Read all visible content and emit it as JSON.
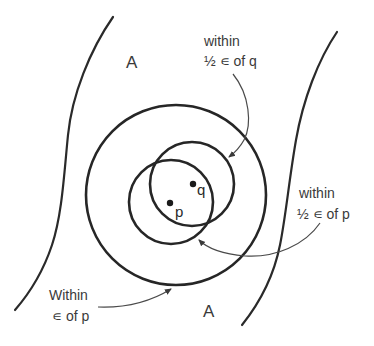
{
  "diagram": {
    "regions": [
      {
        "id": "region-a-top",
        "label": "A"
      },
      {
        "id": "region-a-bottom",
        "label": "A"
      }
    ],
    "points": [
      {
        "id": "p",
        "label": "p"
      },
      {
        "id": "q",
        "label": "q"
      }
    ],
    "annotations": {
      "half_eps_q": {
        "line1": "within",
        "line2": "½ ∊ of q"
      },
      "half_eps_p": {
        "line1": "within",
        "line2": "½ ∊ of p"
      },
      "eps_p": {
        "line1": "Within",
        "line2": "∊ of p"
      }
    },
    "colors": {
      "stroke": "#262626",
      "text": "#3a3a3a",
      "background": "#ffffff"
    }
  }
}
